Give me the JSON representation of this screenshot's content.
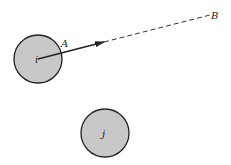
{
  "diagram": {
    "colors": {
      "circle_fill": "#c8c8c8",
      "stroke": "#222222",
      "background": "#ffffff"
    },
    "circle_i": {
      "label": "i",
      "cx": 38,
      "cy": 59,
      "r": 24
    },
    "circle_j": {
      "label": "j",
      "cx": 105,
      "cy": 133,
      "r": 24
    },
    "point_a": {
      "label": "A",
      "x": 62,
      "y": 50
    },
    "point_b": {
      "label": "B",
      "x": 213,
      "y": 16
    },
    "arrow": {
      "from": [
        38,
        59
      ],
      "to": [
        104,
        42
      ]
    },
    "dashed_line": {
      "from": [
        104,
        42
      ],
      "to": [
        210,
        15
      ]
    }
  }
}
